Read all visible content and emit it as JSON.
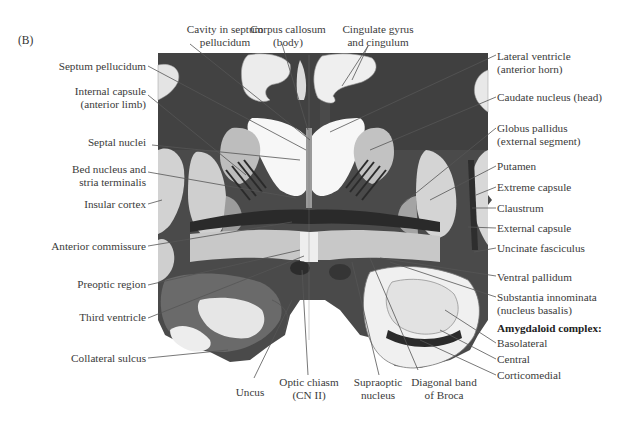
{
  "figure": {
    "panel_label": "(B)",
    "colors": {
      "background": "#ffffff",
      "tissue_dark": "#3b3b3b",
      "tissue_mid": "#8a8a8a",
      "tissue_light": "#d8d8d8",
      "white_area": "#f2f2f2",
      "leader_line": "#555555",
      "text": "#3a3a3a"
    }
  },
  "labels": {
    "top": [
      {
        "id": "cavity-septum",
        "line1": "Cavity in septum",
        "line2": "pellucidum"
      },
      {
        "id": "corpus-callosum",
        "line1": "Corpus callosum",
        "line2": "(body)"
      },
      {
        "id": "cingulate",
        "line1": "Cingulate gyrus",
        "line2": "and cingulum"
      }
    ],
    "left": [
      {
        "id": "septum-pellucidum",
        "line1": "Septum pellucidum"
      },
      {
        "id": "internal-capsule",
        "line1": "Internal capsule",
        "line2": "(anterior limb)"
      },
      {
        "id": "septal-nuclei",
        "line1": "Septal nuclei"
      },
      {
        "id": "bed-nucleus",
        "line1": "Bed nucleus and",
        "line2": "stria terminalis"
      },
      {
        "id": "insular-cortex",
        "line1": "Insular cortex"
      },
      {
        "id": "anterior-commissure",
        "line1": "Anterior commissure"
      },
      {
        "id": "preoptic-region",
        "line1": "Preoptic region"
      },
      {
        "id": "third-ventricle",
        "line1": "Third ventricle"
      },
      {
        "id": "collateral-sulcus",
        "line1": "Collateral sulcus"
      }
    ],
    "right": [
      {
        "id": "lateral-ventricle",
        "line1": "Lateral ventricle",
        "line2": "(anterior horn)"
      },
      {
        "id": "caudate-nucleus",
        "line1": "Caudate nucleus (head)"
      },
      {
        "id": "globus-pallidus",
        "line1": "Globus pallidus",
        "line2": "(external segment)"
      },
      {
        "id": "putamen",
        "line1": "Putamen"
      },
      {
        "id": "extreme-capsule",
        "line1": "Extreme capsule"
      },
      {
        "id": "claustrum",
        "line1": "Claustrum"
      },
      {
        "id": "external-capsule",
        "line1": "External capsule"
      },
      {
        "id": "uncinate-fasciculus",
        "line1": "Uncinate fasciculus"
      },
      {
        "id": "ventral-pallidum",
        "line1": "Ventral pallidum"
      },
      {
        "id": "substantia-innominata",
        "line1": "Substantia innominata",
        "line2": "(nucleus basalis)"
      },
      {
        "id": "amygdaloid-heading",
        "line1": "Amygdaloid complex:"
      },
      {
        "id": "basolateral",
        "line1": "Basolateral"
      },
      {
        "id": "central",
        "line1": "Central"
      },
      {
        "id": "corticomedial",
        "line1": "Corticomedial"
      }
    ],
    "bottom": [
      {
        "id": "uncus",
        "line1": "Uncus"
      },
      {
        "id": "optic-chiasm",
        "line1": "Optic chiasm",
        "line2": "(CN II)"
      },
      {
        "id": "supraoptic",
        "line1": "Supraoptic",
        "line2": "nucleus"
      },
      {
        "id": "diagonal-band",
        "line1": "Diagonal band",
        "line2": "of Broca"
      }
    ]
  }
}
